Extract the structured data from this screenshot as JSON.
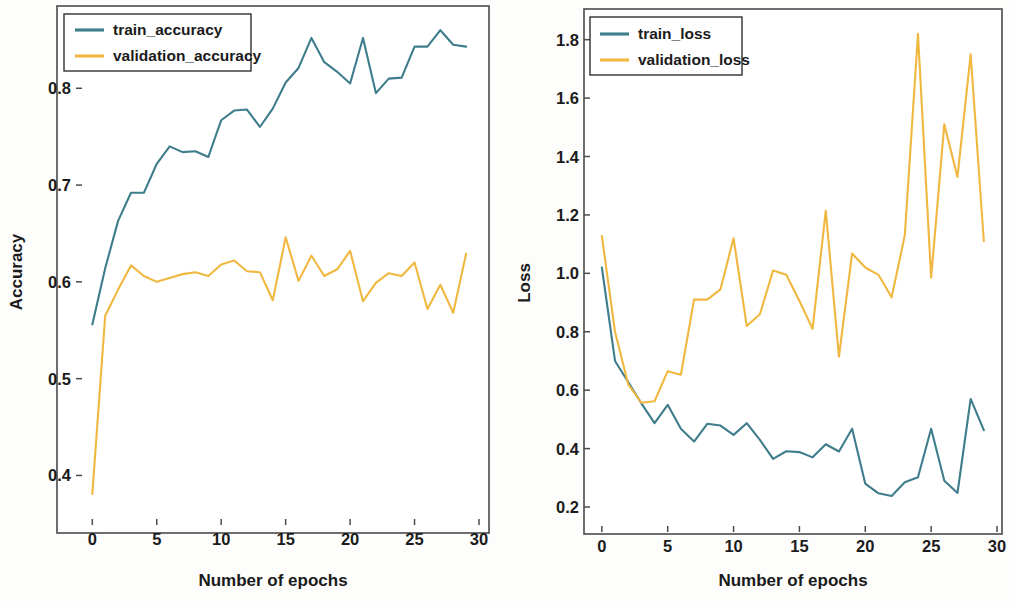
{
  "figure": {
    "background": "#fdfdfc",
    "panel_count": 2
  },
  "chart_data": [
    {
      "id": "accuracy",
      "type": "line",
      "title": "",
      "xlabel": "Number of epochs",
      "ylabel": "Accuracy",
      "xlim": [
        -0.8,
        30.0
      ],
      "ylim": [
        0.355,
        0.885
      ],
      "xticks": [
        0,
        5,
        10,
        15,
        20,
        25,
        30
      ],
      "xtick_labels": [
        "0",
        "5",
        "10",
        "15",
        "20",
        "25",
        "30"
      ],
      "yticks": [
        0.4,
        0.5,
        0.6,
        0.7,
        0.8
      ],
      "ytick_labels": [
        "0.4",
        "0.5",
        "0.6",
        "0.7",
        "0.8"
      ],
      "grid": false,
      "legend_position": "upper left",
      "x": [
        0,
        1,
        2,
        3,
        4,
        5,
        6,
        7,
        8,
        9,
        10,
        11,
        12,
        13,
        14,
        15,
        16,
        17,
        18,
        19,
        20,
        21,
        22,
        23,
        24,
        25,
        26,
        27,
        28,
        29
      ],
      "series": [
        {
          "name": "train_accuracy",
          "color": "#3f7d8c",
          "values": [
            0.556,
            0.614,
            0.663,
            0.692,
            0.692,
            0.722,
            0.74,
            0.734,
            0.735,
            0.729,
            0.767,
            0.777,
            0.778,
            0.76,
            0.779,
            0.806,
            0.821,
            0.852,
            0.827,
            0.817,
            0.805,
            0.852,
            0.795,
            0.81,
            0.811,
            0.843,
            0.843,
            0.86,
            0.845,
            0.843
          ]
        },
        {
          "name": "validation_accuracy",
          "color": "#f0b840",
          "values": [
            0.381,
            0.565,
            0.592,
            0.617,
            0.606,
            0.6,
            0.604,
            0.608,
            0.61,
            0.606,
            0.618,
            0.622,
            0.611,
            0.61,
            0.581,
            0.646,
            0.601,
            0.627,
            0.606,
            0.613,
            0.632,
            0.58,
            0.599,
            0.609,
            0.606,
            0.62,
            0.572,
            0.597,
            0.568,
            0.629
          ]
        }
      ]
    },
    {
      "id": "loss",
      "type": "line",
      "title": "",
      "xlabel": "Number of epochs",
      "ylabel": "Loss",
      "xlim": [
        -0.9,
        30.0
      ],
      "ylim": [
        0.135,
        1.905
      ],
      "xticks": [
        0,
        5,
        10,
        15,
        20,
        25,
        30
      ],
      "xtick_labels": [
        "0",
        "5",
        "10",
        "15",
        "20",
        "25",
        "30"
      ],
      "yticks": [
        0.2,
        0.4,
        0.6,
        0.8,
        1.0,
        1.2,
        1.4,
        1.6,
        1.8
      ],
      "ytick_labels": [
        "0.2",
        "0.4",
        "0.6",
        "0.8",
        "1.0",
        "1.2",
        "1.4",
        "1.6",
        "1.8"
      ],
      "grid": false,
      "legend_position": "upper left",
      "x": [
        0,
        1,
        2,
        3,
        4,
        5,
        6,
        7,
        8,
        9,
        10,
        11,
        12,
        13,
        14,
        15,
        16,
        17,
        18,
        19,
        20,
        21,
        22,
        23,
        24,
        25,
        26,
        27,
        28,
        29
      ],
      "series": [
        {
          "name": "train_loss",
          "color": "#3f7d8c",
          "values": [
            1.02,
            0.7,
            0.628,
            0.555,
            0.487,
            0.55,
            0.468,
            0.424,
            0.485,
            0.479,
            0.447,
            0.487,
            0.43,
            0.365,
            0.391,
            0.388,
            0.37,
            0.415,
            0.39,
            0.468,
            0.28,
            0.247,
            0.238,
            0.285,
            0.302,
            0.468,
            0.29,
            0.248,
            0.57,
            0.463,
            0.33,
            0.32,
            0.305,
            0.258,
            0.338,
            0.29
          ]
        },
        {
          "name": "validation_loss",
          "color": "#f0b840",
          "values": [
            1.128,
            0.8,
            0.62,
            0.557,
            0.562,
            0.665,
            0.653,
            0.91,
            0.91,
            0.945,
            1.12,
            0.82,
            0.86,
            1.01,
            0.995,
            0.905,
            0.81,
            1.215,
            0.715,
            1.068,
            1.02,
            0.995,
            0.918,
            1.13,
            1.82,
            0.985,
            1.51,
            1.33,
            1.75,
            1.11
          ]
        }
      ]
    }
  ]
}
